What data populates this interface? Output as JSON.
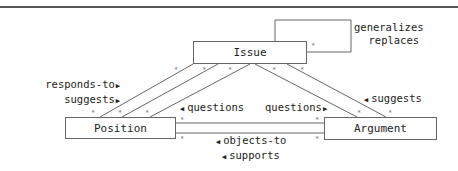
{
  "nodes": {
    "issue": "Issue",
    "position": "Position",
    "argument": "Argument"
  },
  "labels": {
    "self_loop": [
      "generalizes",
      "replaces"
    ],
    "issue_position": [
      "responds-to",
      "suggests"
    ],
    "position_issue": "questions",
    "argument_issue_q": "questions",
    "argument_issue_s": "suggests",
    "argument_position": [
      "objects-to",
      "supports"
    ]
  },
  "multiplicity": "*",
  "colors": {
    "line": "#666666",
    "text": "#222222",
    "rule": "#555555"
  }
}
